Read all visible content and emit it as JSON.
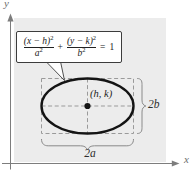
{
  "figure": {
    "panel_bg": "#ececec",
    "axis_color": "#7d7d7d",
    "dash_color": "#9a9a9a",
    "brace_color": "#8a8a8a",
    "ellipse_color": "#141414",
    "callout_bg": "#ffffff",
    "callout_border": "#3c3c3c"
  },
  "axes": {
    "x_label": "x",
    "y_label": "y"
  },
  "callout": {
    "frac1_num": "(x − h)",
    "frac1_num_sup": "2",
    "frac1_den": "a",
    "frac1_den_sup": "2",
    "plus": "+",
    "frac2_num": "(y − k)",
    "frac2_num_sup": "2",
    "frac2_den": "b",
    "frac2_den_sup": "2",
    "equals": "=",
    "rhs": "1"
  },
  "labels": {
    "center": "(h, k)",
    "width": "2a",
    "height": "2b"
  }
}
